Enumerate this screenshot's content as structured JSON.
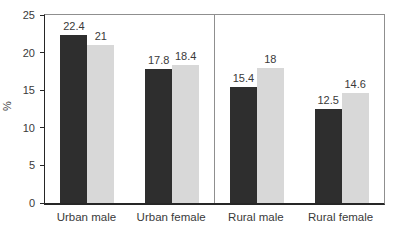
{
  "chart_data": {
    "type": "bar",
    "title": "",
    "xlabel": "",
    "ylabel": "%",
    "ylim": [
      0,
      25
    ],
    "yticks": [
      0,
      5,
      10,
      15,
      20,
      25
    ],
    "grid": false,
    "legend_position": "none",
    "data_labels": true,
    "categories": [
      "Urban male",
      "Urban female",
      "Rural male",
      "Rural female"
    ],
    "series": [
      {
        "name": "dark-series",
        "color": "#2e2e2e",
        "values": [
          22.4,
          17.8,
          15.4,
          12.5
        ]
      },
      {
        "name": "light-series",
        "color": "#d8d8d8",
        "values": [
          21,
          18.4,
          18,
          14.6
        ]
      }
    ],
    "divider_after_category_index": 1,
    "frame_color": "#8f8f8f",
    "axis_color": "#262626",
    "text_color": "#3a3a3a"
  }
}
